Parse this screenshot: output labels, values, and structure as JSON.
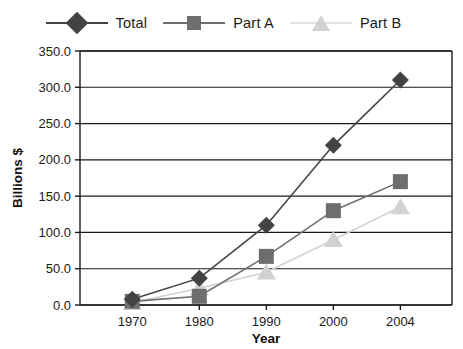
{
  "chart_data": {
    "type": "line",
    "title": "",
    "xlabel": "Year",
    "ylabel": "Billions $",
    "categories": [
      "1970",
      "1980",
      "1990",
      "2000",
      "2004"
    ],
    "x": [
      1970,
      1980,
      1990,
      2000,
      2004
    ],
    "series": [
      {
        "name": "Total",
        "values": [
          8,
          37,
          110,
          220,
          310
        ],
        "color": "#434343",
        "marker": "diamond"
      },
      {
        "name": "Part A",
        "values": [
          5,
          12,
          67,
          130,
          170
        ],
        "color": "#6e6e6e",
        "marker": "square"
      },
      {
        "name": "Part B",
        "values": [
          3,
          23,
          45,
          90,
          135
        ],
        "color": "#d2d2d2",
        "marker": "triangle"
      }
    ],
    "ylim": [
      0,
      350
    ],
    "yticks": [
      "0.0",
      "50.0",
      "100.0",
      "150.0",
      "200.0",
      "250.0",
      "300.0",
      "350.0"
    ],
    "ytick_values": [
      0,
      50,
      100,
      150,
      200,
      250,
      300,
      350
    ],
    "grid": true,
    "legend_position": "top"
  },
  "legend": {
    "items": [
      {
        "label": "Total"
      },
      {
        "label": "Part A"
      },
      {
        "label": "Part B"
      }
    ]
  },
  "axes": {
    "x_title": "Year",
    "y_title": "Billions $"
  },
  "colors": {
    "total": "#434343",
    "part_a": "#6e6e6e",
    "part_b": "#d2d2d2",
    "axis": "#1a1a1a",
    "grid": "#1a1a1a",
    "background": "#ffffff"
  }
}
